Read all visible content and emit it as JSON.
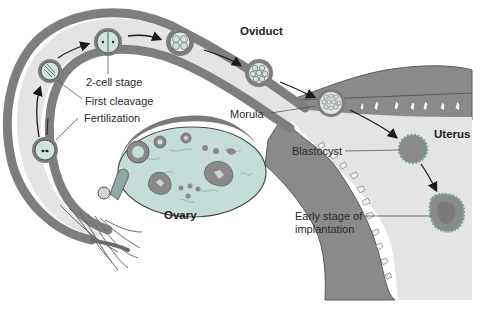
{
  "diagram": {
    "colors": {
      "tissue_wall": "#7a7a7a",
      "lumen": "#e4e4e4",
      "embryo_fill": "#cfe3df",
      "ovary_fill": "#c5ddd9",
      "outline": "#3c3c3c",
      "arrow": "#1a1a1a",
      "background": "#ffffff"
    },
    "region_labels": {
      "oviduct": "Oviduct",
      "uterus": "Uterus",
      "ovary": "Ovary"
    },
    "stage_labels": {
      "fertilization": "Fertilization",
      "first_cleavage": "First cleavage",
      "two_cell": "2-cell stage",
      "morula": "Morula",
      "blastocyst": "Blastocyst",
      "implantation_line1": "Early stage of",
      "implantation_line2": "implantation"
    },
    "stages_in_order": [
      "Fertilization",
      "First cleavage",
      "2-cell stage",
      "4-cell stage",
      "8-cell stage",
      "Morula",
      "Blastocyst",
      "Early stage of implantation"
    ]
  }
}
